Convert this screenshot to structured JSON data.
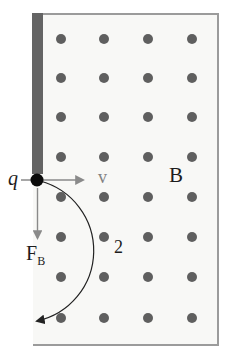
{
  "diagram": {
    "labels": {
      "charge": "q",
      "velocity": "v",
      "field": "B",
      "force": "F",
      "force_subscript": "B",
      "path_label": "2"
    },
    "field_region": {
      "dot_columns_x": [
        61,
        104,
        148,
        192
      ],
      "dot_rows_y": [
        39,
        78,
        117,
        157,
        197,
        237,
        277,
        318
      ],
      "dot_diameter": 10
    },
    "colors": {
      "field_background": "#f8f8f6",
      "region_border": "#9b9b9b",
      "bar": "#646464",
      "field_dot": "#5f5f5f",
      "charge_dot": "#0b0b0b",
      "vector_arrow": "#8a8a8a",
      "trajectory": "#222222",
      "velocity_label": "#828282",
      "text": "#1d1d1d"
    }
  }
}
